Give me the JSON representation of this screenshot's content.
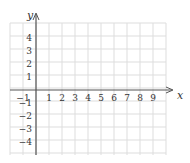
{
  "chart_data": {
    "type": "scatter",
    "title": "",
    "xlabel": "x",
    "ylabel": "y",
    "xlim": [
      -2,
      10
    ],
    "ylim": [
      -5,
      5
    ],
    "grid": true,
    "legend": null,
    "x_ticks": [
      "-1",
      "1",
      "2",
      "3",
      "4",
      "5",
      "6",
      "7",
      "8",
      "9"
    ],
    "y_ticks": [
      "4",
      "3",
      "2",
      "1",
      "-1",
      "-2",
      "-3",
      "-4"
    ],
    "series": []
  },
  "colors": {
    "grid": "#dddddd",
    "axis": "#555555",
    "text": "#333333"
  }
}
